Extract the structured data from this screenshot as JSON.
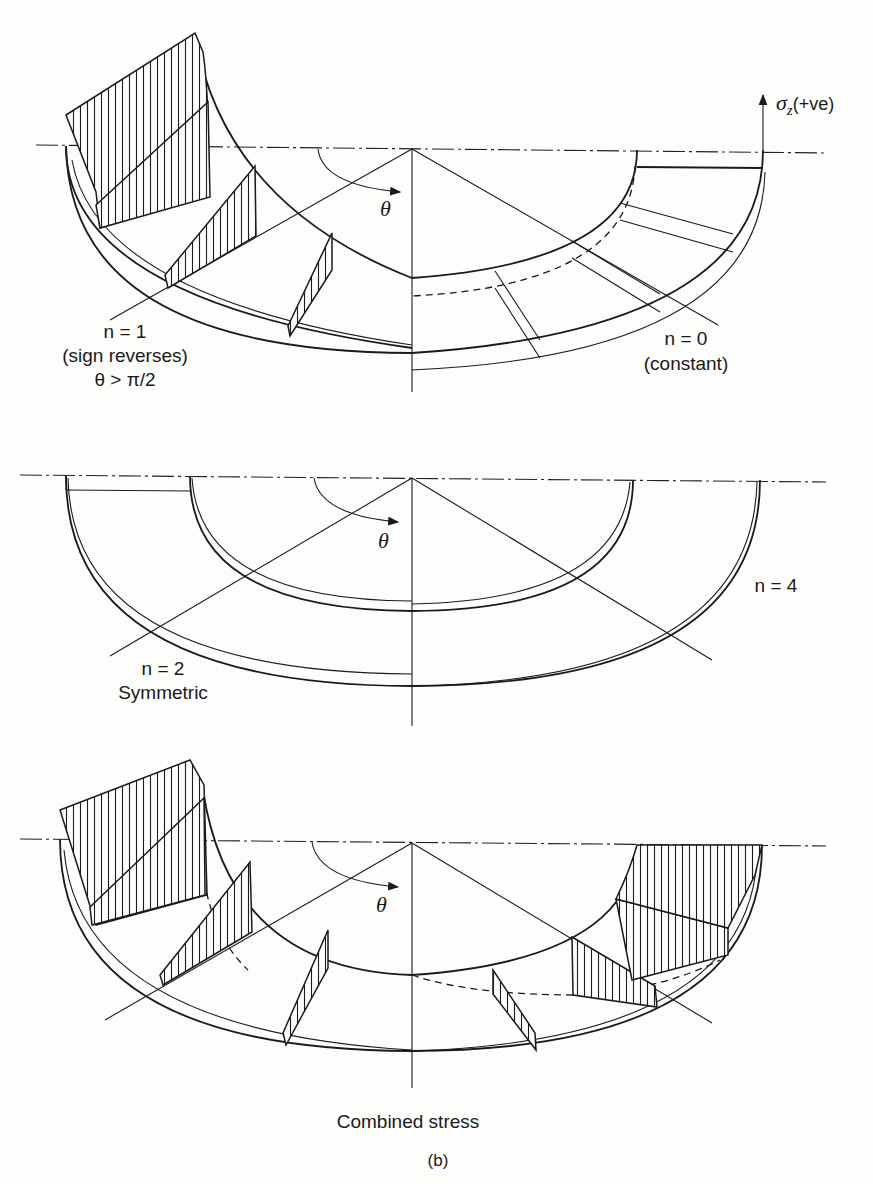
{
  "figure": {
    "caption": "(b)",
    "stress_axis_label": "σz(+ve)",
    "stress_axis_symbol": "σ",
    "stress_axis_subscript": "z",
    "stress_axis_suffix": "(+ve)",
    "theta_symbol": "θ",
    "panels": [
      {
        "id": "top",
        "labels": [
          {
            "id": "n1",
            "lines": [
              "n = 1",
              "(sign reverses)",
              "θ > π/2"
            ]
          },
          {
            "id": "n0",
            "lines": [
              "n = 0",
              "(constant)"
            ]
          }
        ]
      },
      {
        "id": "middle",
        "labels": [
          {
            "id": "n2",
            "lines": [
              "n = 2",
              "Symmetric"
            ]
          },
          {
            "id": "n4",
            "lines": [
              "n = 4"
            ]
          }
        ]
      },
      {
        "id": "bottom",
        "labels": [
          {
            "id": "combined",
            "lines": [
              "Combined stress"
            ]
          }
        ]
      }
    ]
  },
  "text": {
    "n1_line1": "n = 1",
    "n1_line2": "(sign reverses)",
    "n1_line3": "θ > π/2",
    "n0_line1": "n = 0",
    "n0_line2": "(constant)",
    "n2_line1": "n = 2",
    "n2_line2": "Symmetric",
    "n4_line1": "n = 4",
    "combined": "Combined stress",
    "caption": "(b)",
    "theta": "θ",
    "sigma": "σ",
    "sigma_sub": "z",
    "sigma_suffix": "(+ve)"
  },
  "colors": {
    "ink": "#1a1a1a",
    "paper": "#fdfdfb"
  }
}
